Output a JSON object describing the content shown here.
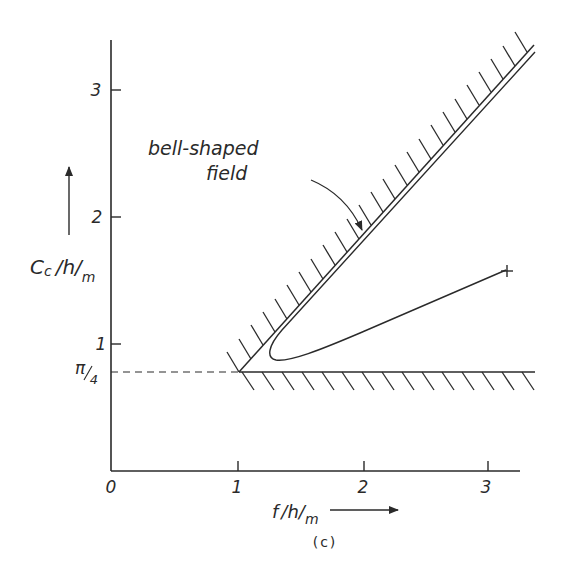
{
  "figure": {
    "caption": "(c)",
    "annotation": {
      "line1": "bell-shaped",
      "line2": "field"
    },
    "y_axis": {
      "label_main": "C",
      "label_sub": "c",
      "label_rest": "/h/",
      "label_rest_sub": "m",
      "ticks": [
        {
          "value": 1,
          "label": "1"
        },
        {
          "value": 2,
          "label": "2"
        },
        {
          "value": 3,
          "label": "3"
        }
      ],
      "special_tick": {
        "value": 0.785,
        "label_num": "π",
        "label_den": "4"
      }
    },
    "x_axis": {
      "label_main": "f",
      "label_rest": "/h/",
      "label_rest_sub": "m",
      "ticks": [
        {
          "value": 0,
          "label": "0"
        },
        {
          "value": 1,
          "label": "1"
        },
        {
          "value": 2,
          "label": "2"
        },
        {
          "value": 3,
          "label": "3"
        }
      ]
    },
    "colors": {
      "ink": "#2a2a2a",
      "background": "#ffffff"
    }
  }
}
